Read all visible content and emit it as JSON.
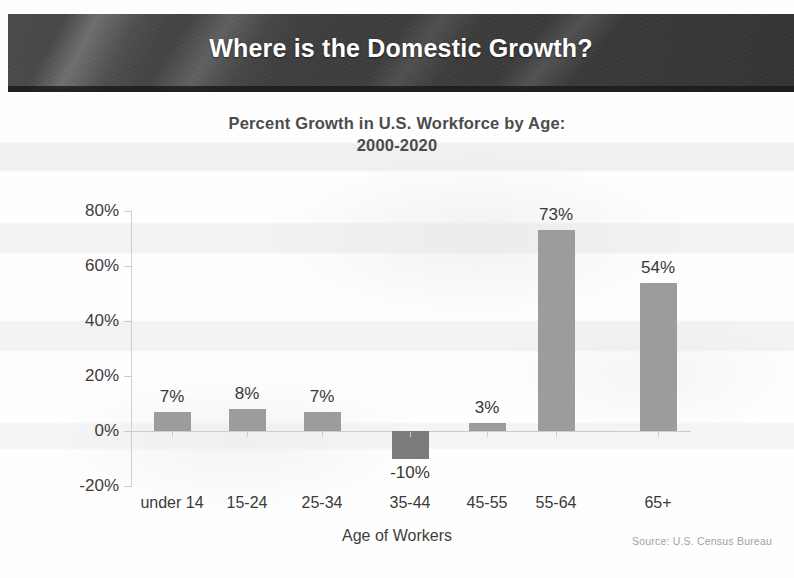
{
  "slide": {
    "banner_title": "Where is the Domestic Growth?"
  },
  "chart_data": {
    "type": "bar",
    "title": "Percent Growth in U.S. Workforce by Age:",
    "subtitle": "2000-2020",
    "title_line1": "Percent Growth in U.S. Workforce by Age:",
    "title_line2": "2000-2020",
    "xlabel": "Age of Workers",
    "ylabel": "",
    "categories": [
      "under 14",
      "15-24",
      "25-34",
      "35-44",
      "45-55",
      "55-64",
      "65+"
    ],
    "values": [
      7,
      8,
      7,
      -10,
      3,
      73,
      54
    ],
    "value_labels": [
      "7%",
      "8%",
      "7%",
      "-10%",
      "3%",
      "73%",
      "54%"
    ],
    "ylim": [
      -20,
      80
    ],
    "ytick_labels": [
      "80%",
      "60%",
      "40%",
      "20%",
      "0%",
      "-20%"
    ],
    "ytick_values": [
      80,
      60,
      40,
      20,
      0,
      -20
    ],
    "grid": false,
    "legend": null,
    "source_note": "Source: U.S. Census Bureau",
    "bar_color": "#9c9c9c",
    "negative_bar_color": "#7b7b7b",
    "axis_color": "#cccccc"
  }
}
